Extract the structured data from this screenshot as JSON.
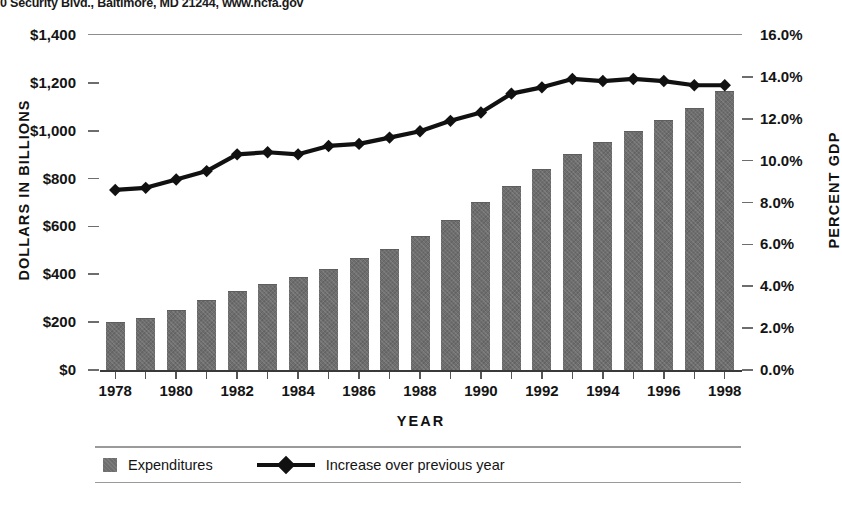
{
  "header": {
    "cropped_text": "0 Security Blvd., Baltimore, MD 21244, www.hcfa.gov"
  },
  "axes": {
    "y_left_title": "DOLLARS IN BILLIONS",
    "y_right_title": "PERCENT GDP",
    "x_title": "YEAR",
    "y_left_ticks": [
      "$1,400",
      "$1,200",
      "$1,000",
      "$800",
      "$600",
      "$400",
      "$200",
      "$0"
    ],
    "y_right_ticks": [
      "16.0%",
      "14.0%",
      "12.0%",
      "10.0%",
      "8.0%",
      "6.0%",
      "4.0%",
      "2.0%",
      "0.0%"
    ],
    "x_ticks": [
      "1978",
      "1980",
      "1982",
      "1984",
      "1986",
      "1988",
      "1990",
      "1992",
      "1994",
      "1996",
      "1998"
    ]
  },
  "legend": {
    "bar_label": "Expenditures",
    "line_label": "Increase over previous year"
  },
  "colors": {
    "bar_fill": "#6e6e6e",
    "line": "#111111",
    "axis": "#3a3a3a",
    "text": "#141414",
    "background": "#ffffff"
  },
  "chart_data": {
    "type": "bar",
    "title": "",
    "subtitle": "",
    "xlabel": "YEAR",
    "ylabel": "DOLLARS IN BILLIONS",
    "y2label": "PERCENT GDP",
    "ylim": [
      0,
      1400
    ],
    "y2lim": [
      0,
      16
    ],
    "grid": false,
    "legend_position": "bottom",
    "categories": [
      "1978",
      "1979",
      "1980",
      "1981",
      "1982",
      "1983",
      "1984",
      "1985",
      "1986",
      "1987",
      "1988",
      "1989",
      "1990",
      "1991",
      "1992",
      "1993",
      "1994",
      "1995",
      "1996",
      "1997",
      "1998"
    ],
    "series": [
      {
        "name": "Expenditures",
        "type": "bar",
        "axis": "left",
        "unit": "billions of dollars",
        "values": [
          195,
          215,
          247,
          287,
          324,
          354,
          385,
          418,
          464,
          500,
          555,
          624,
          696,
          765,
          836,
          899,
          948,
          995,
          1040,
          1090,
          1160
        ]
      },
      {
        "name": "Increase over previous year",
        "type": "line",
        "axis": "right",
        "unit": "percent of GDP",
        "values": [
          8.6,
          8.7,
          9.1,
          9.5,
          10.3,
          10.4,
          10.3,
          10.7,
          10.8,
          11.1,
          11.4,
          11.9,
          12.3,
          13.2,
          13.5,
          13.9,
          13.8,
          13.9,
          13.8,
          13.6,
          13.6
        ]
      }
    ]
  }
}
